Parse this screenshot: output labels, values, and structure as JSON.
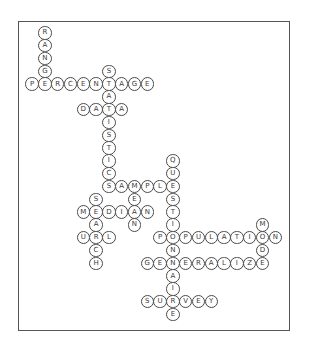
{
  "puzzle": {
    "type": "crossword-word-map",
    "grid": {
      "origin_x": 31.5,
      "origin_y": 32.3,
      "step": 12.8
    },
    "colors": {
      "frame": "#555555",
      "circle_border": "#4a4a4a",
      "letter": "#3a3a3a",
      "background": "#ffffff"
    },
    "words": [
      {
        "word": "RANGE",
        "col": 1,
        "row": 0,
        "dir": "down"
      },
      {
        "word": "PERCENTAGE",
        "col": 0,
        "row": 4,
        "dir": "across"
      },
      {
        "word": "STATISTICS",
        "col": 6,
        "row": 3,
        "dir": "down"
      },
      {
        "word": "DATA",
        "col": 4,
        "row": 6,
        "dir": "across"
      },
      {
        "word": "SAMPLE",
        "col": 6,
        "row": 12,
        "dir": "across"
      },
      {
        "word": "QUESTIONNAIRE",
        "col": 11,
        "row": 10,
        "dir": "down"
      },
      {
        "word": "MEAN",
        "col": 8,
        "row": 12,
        "dir": "down"
      },
      {
        "word": "SEARCH",
        "col": 5,
        "row": 13,
        "dir": "down"
      },
      {
        "word": "MEDIAN",
        "col": 4,
        "row": 14,
        "dir": "across"
      },
      {
        "word": "URL",
        "col": 4,
        "row": 16,
        "dir": "across"
      },
      {
        "word": "POPULATION",
        "col": 10,
        "row": 16,
        "dir": "across"
      },
      {
        "word": "MODE",
        "col": 18,
        "row": 15,
        "dir": "down"
      },
      {
        "word": "GENERALIZE",
        "col": 9,
        "row": 18,
        "dir": "across"
      },
      {
        "word": "SURVEY",
        "col": 9,
        "row": 21,
        "dir": "across"
      }
    ]
  }
}
